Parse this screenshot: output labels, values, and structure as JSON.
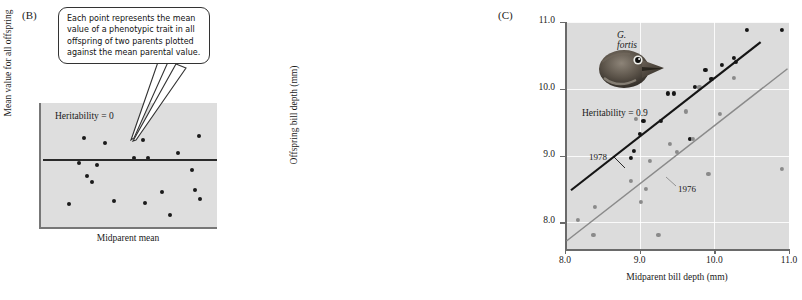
{
  "figure": {
    "panel_b": {
      "label": "(B)",
      "callout_text": "Each point represents the mean value of a phenotypic trait in all offspring of two parents plotted against the mean parental value.",
      "heritability_label": "Heritability = 0",
      "ylabel": "Mean value for all offspring",
      "xlabel": "Midparent mean"
    },
    "panel_c": {
      "label": "(C)",
      "species_label": "G. fortis",
      "heritability_label": "Heritability = 0.9",
      "series_label_1978": "1978",
      "series_label_1976": "1976",
      "ylabel": "Offspring bill depth (mm)",
      "xlabel": "Midparent bill depth (mm)"
    }
  },
  "chart_data": [
    {
      "type": "scatter",
      "panel": "B",
      "title": "Heritability = 0",
      "xlabel": "Midparent mean",
      "ylabel": "Mean value for all offspring",
      "xlim": [
        0,
        100
      ],
      "ylim": [
        0,
        100
      ],
      "grid": false,
      "axis_ticks": false,
      "annotation": "Each point represents the mean value of a phenotypic trait in all offspring of two parents plotted against the mean parental value.",
      "points": [
        {
          "x": 16.0,
          "y": 20.0
        },
        {
          "x": 28.5,
          "y": 37.0
        },
        {
          "x": 24.0,
          "y": 72.0
        },
        {
          "x": 36.0,
          "y": 68.0
        },
        {
          "x": 21.5,
          "y": 52.5
        },
        {
          "x": 31.5,
          "y": 50.5
        },
        {
          "x": 26.0,
          "y": 42.0
        },
        {
          "x": 41.0,
          "y": 22.0
        },
        {
          "x": 52.0,
          "y": 56.0
        },
        {
          "x": 60.0,
          "y": 56.0
        },
        {
          "x": 57.5,
          "y": 70.5
        },
        {
          "x": 58.5,
          "y": 21.0
        },
        {
          "x": 68.0,
          "y": 29.5
        },
        {
          "x": 72.5,
          "y": 11.0
        },
        {
          "x": 77.0,
          "y": 60.5
        },
        {
          "x": 85.0,
          "y": 46.5
        },
        {
          "x": 86.5,
          "y": 31.0
        },
        {
          "x": 89.5,
          "y": 24.0
        },
        {
          "x": 88.5,
          "y": 73.5
        }
      ],
      "regression_line": {
        "slope": 0,
        "y_at_left": 55.5,
        "y_at_right": 55.5
      }
    },
    {
      "type": "scatter",
      "panel": "C",
      "title": "Heritability = 0.9",
      "xlabel": "Midparent bill depth (mm)",
      "ylabel": "Offspring bill depth (mm)",
      "xlim": [
        8.0,
        11.0
      ],
      "ylim": [
        7.6,
        11.0
      ],
      "xticks": [
        "8.0",
        "9.0",
        "10.0",
        "11.0"
      ],
      "yticks": [
        "8.0",
        "9.0",
        "10.0",
        "11.0"
      ],
      "grid": true,
      "legend_position": "inline-annotations",
      "series": [
        {
          "name": "1978",
          "color": "#151515",
          "points": [
            {
              "x": 8.88,
              "y": 8.97
            },
            {
              "x": 8.92,
              "y": 9.07
            },
            {
              "x": 9.0,
              "y": 9.32
            },
            {
              "x": 9.05,
              "y": 9.52
            },
            {
              "x": 9.28,
              "y": 9.52
            },
            {
              "x": 9.38,
              "y": 9.93
            },
            {
              "x": 9.46,
              "y": 9.93
            },
            {
              "x": 9.67,
              "y": 9.25
            },
            {
              "x": 9.74,
              "y": 10.03
            },
            {
              "x": 9.88,
              "y": 10.28
            },
            {
              "x": 9.96,
              "y": 10.15
            },
            {
              "x": 10.1,
              "y": 10.36
            },
            {
              "x": 10.26,
              "y": 10.46
            },
            {
              "x": 10.29,
              "y": 10.4
            },
            {
              "x": 10.44,
              "y": 10.88
            },
            {
              "x": 10.9,
              "y": 10.88
            }
          ]
        },
        {
          "name": "1976",
          "color": "#8a8a8a",
          "points": [
            {
              "x": 8.17,
              "y": 8.03
            },
            {
              "x": 8.38,
              "y": 7.81
            },
            {
              "x": 8.4,
              "y": 8.23
            },
            {
              "x": 8.88,
              "y": 8.62
            },
            {
              "x": 8.95,
              "y": 9.55
            },
            {
              "x": 9.02,
              "y": 8.3
            },
            {
              "x": 9.08,
              "y": 8.5
            },
            {
              "x": 9.14,
              "y": 8.92
            },
            {
              "x": 9.25,
              "y": 7.81
            },
            {
              "x": 9.4,
              "y": 9.18
            },
            {
              "x": 9.5,
              "y": 9.05
            },
            {
              "x": 9.62,
              "y": 9.66
            },
            {
              "x": 9.71,
              "y": 9.25
            },
            {
              "x": 9.8,
              "y": 10.02
            },
            {
              "x": 9.92,
              "y": 8.72
            },
            {
              "x": 10.08,
              "y": 9.62
            },
            {
              "x": 10.26,
              "y": 10.16
            },
            {
              "x": 10.9,
              "y": 8.8
            }
          ]
        }
      ],
      "regression_lines": [
        {
          "name": "1978",
          "color": "#151515",
          "x0": 8.08,
          "y0": 8.48,
          "x1": 10.62,
          "y1": 10.7
        },
        {
          "name": "1976",
          "color": "#8a8a8a",
          "x0": 8.02,
          "y0": 7.72,
          "x1": 10.98,
          "y1": 10.3
        }
      ]
    }
  ]
}
